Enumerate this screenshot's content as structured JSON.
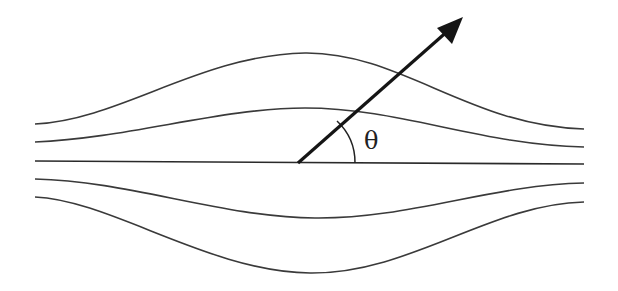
{
  "diagram": {
    "angle_label": "θ",
    "streamlines": [
      {
        "name": "top-outer",
        "left_y": 124,
        "right_y": 129,
        "extreme_y": 53,
        "direction": "up"
      },
      {
        "name": "top-inner",
        "left_y": 142,
        "right_y": 147,
        "extreme_y": 108,
        "direction": "up"
      },
      {
        "name": "center",
        "left_y": 161,
        "right_y": 165,
        "direction": "flat"
      },
      {
        "name": "bottom-inner",
        "left_y": 179,
        "right_y": 183,
        "extreme_y": 218,
        "direction": "down"
      },
      {
        "name": "bottom-outer",
        "left_y": 197,
        "right_y": 202,
        "extreme_y": 273,
        "direction": "down"
      }
    ],
    "vector": {
      "origin": [
        298,
        163
      ],
      "tip": [
        462,
        18
      ]
    },
    "colors": {
      "line": "#3a3a3a",
      "arrow": "#151515",
      "background": "#ffffff"
    }
  }
}
